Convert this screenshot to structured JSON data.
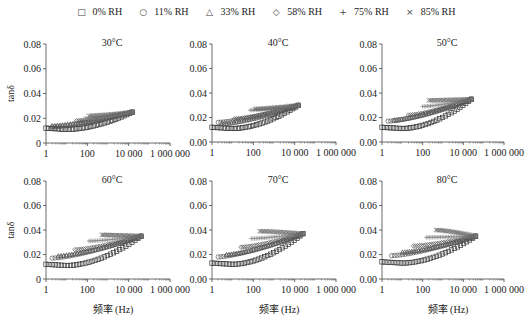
{
  "legend": [
    {
      "symbol": "□",
      "label": "0% RH"
    },
    {
      "symbol": "○",
      "label": "11% RH"
    },
    {
      "symbol": "△",
      "label": "33% RH"
    },
    {
      "symbol": "◇",
      "label": "58% RH"
    },
    {
      "symbol": "+",
      "label": "75% RH"
    },
    {
      "symbol": "×",
      "label": "85% RH"
    }
  ],
  "chart_data": [
    {
      "type": "scatter",
      "title": "30°C",
      "xlabel": "",
      "ylabel": "tanδ",
      "xscale": "log",
      "xlim": [
        1,
        1000000
      ],
      "ylim": [
        0,
        0.08
      ],
      "xticks": [
        "1",
        "100",
        "10 000",
        "1 000 000"
      ],
      "yticks": [
        "0",
        "0.02",
        "0.04",
        "0.06",
        "0.08"
      ],
      "series": [
        {
          "name": "0% RH",
          "start": [
            1,
            0.012
          ],
          "min": [
            10,
            0.011
          ],
          "end": [
            15000,
            0.025
          ]
        },
        {
          "name": "11% RH",
          "start": [
            2,
            0.013
          ],
          "end": [
            15000,
            0.025
          ]
        },
        {
          "name": "33% RH",
          "start": [
            2,
            0.014
          ],
          "peak": [
            8,
            0.016
          ],
          "end": [
            15000,
            0.025
          ]
        },
        {
          "name": "58% RH",
          "start": [
            30,
            0.018
          ],
          "end": [
            15000,
            0.025
          ]
        },
        {
          "name": "75% RH",
          "start": [
            80,
            0.02
          ],
          "end": [
            15000,
            0.025
          ]
        },
        {
          "name": "85% RH",
          "start": [
            120,
            0.022
          ],
          "end": [
            15000,
            0.025
          ]
        }
      ]
    },
    {
      "type": "scatter",
      "title": "40°C",
      "xlabel": "",
      "ylabel": "",
      "xscale": "log",
      "xlim": [
        1,
        1000000
      ],
      "ylim": [
        0,
        0.08
      ],
      "xticks": [
        "1",
        "100",
        "10 000",
        "1 000 000"
      ],
      "yticks": [
        "0.00",
        "0.02",
        "0.04",
        "0.06",
        "0.08"
      ],
      "series": [
        {
          "name": "0% RH",
          "start": [
            1,
            0.012
          ],
          "min": [
            10,
            0.011
          ],
          "end": [
            15000,
            0.03
          ]
        },
        {
          "name": "11% RH",
          "start": [
            2,
            0.016
          ],
          "end": [
            15000,
            0.03
          ]
        },
        {
          "name": "33% RH",
          "start": [
            3,
            0.015
          ],
          "end": [
            15000,
            0.03
          ]
        },
        {
          "name": "58% RH",
          "start": [
            12,
            0.019
          ],
          "end": [
            15000,
            0.03
          ]
        },
        {
          "name": "75% RH",
          "start": [
            70,
            0.026
          ],
          "end": [
            15000,
            0.03
          ]
        },
        {
          "name": "85% RH",
          "start": [
            120,
            0.027
          ],
          "end": [
            15000,
            0.03
          ]
        }
      ]
    },
    {
      "type": "scatter",
      "title": "50°C",
      "xlabel": "",
      "ylabel": "",
      "xscale": "log",
      "xlim": [
        1,
        1000000
      ],
      "ylim": [
        0,
        0.08
      ],
      "xticks": [
        "1",
        "100",
        "10 000",
        "1 000 000"
      ],
      "yticks": [
        "0.00",
        "0.02",
        "0.04",
        "0.06",
        "0.08"
      ],
      "series": [
        {
          "name": "0% RH",
          "start": [
            1,
            0.012
          ],
          "min": [
            10,
            0.011
          ],
          "end": [
            25000,
            0.035
          ]
        },
        {
          "name": "11% RH",
          "start": [
            2,
            0.017
          ],
          "end": [
            25000,
            0.035
          ]
        },
        {
          "name": "33% RH",
          "start": [
            4,
            0.018
          ],
          "end": [
            25000,
            0.035
          ]
        },
        {
          "name": "58% RH",
          "start": [
            20,
            0.022
          ],
          "end": [
            25000,
            0.035
          ]
        },
        {
          "name": "75% RH",
          "start": [
            100,
            0.029
          ],
          "end": [
            25000,
            0.035
          ]
        },
        {
          "name": "85% RH",
          "start": [
            200,
            0.034
          ],
          "end": [
            25000,
            0.035
          ]
        }
      ]
    },
    {
      "type": "scatter",
      "title": "60°C",
      "xlabel": "频率 (Hz)",
      "ylabel": "tanδ",
      "xscale": "log",
      "xlim": [
        1,
        1000000
      ],
      "ylim": [
        0,
        0.08
      ],
      "xticks": [
        "1",
        "100",
        "10 000",
        "1 000 000"
      ],
      "yticks": [
        "0",
        "0.02",
        "0.04",
        "0.06",
        "0.08"
      ],
      "series": [
        {
          "name": "0% RH",
          "start": [
            1,
            0.012
          ],
          "min": [
            10,
            0.011
          ],
          "end": [
            40000,
            0.035
          ]
        },
        {
          "name": "11% RH",
          "start": [
            2,
            0.017
          ],
          "end": [
            40000,
            0.035
          ]
        },
        {
          "name": "33% RH",
          "start": [
            4,
            0.019
          ],
          "end": [
            40000,
            0.035
          ]
        },
        {
          "name": "58% RH",
          "start": [
            25,
            0.024
          ],
          "end": [
            40000,
            0.035
          ]
        },
        {
          "name": "75% RH",
          "start": [
            120,
            0.031
          ],
          "end": [
            40000,
            0.035
          ]
        },
        {
          "name": "85% RH",
          "start": [
            500,
            0.036
          ],
          "end": [
            40000,
            0.035
          ]
        }
      ]
    },
    {
      "type": "scatter",
      "title": "70°C",
      "xlabel": "频率 (Hz)",
      "ylabel": "",
      "xscale": "log",
      "xlim": [
        1,
        1000000
      ],
      "ylim": [
        0,
        0.08
      ],
      "xticks": [
        "1",
        "100",
        "10 000",
        "1 000 000"
      ],
      "yticks": [
        "0.00",
        "0.02",
        "0.04",
        "0.06",
        "0.08"
      ],
      "series": [
        {
          "name": "0% RH",
          "start": [
            1,
            0.013
          ],
          "min": [
            10,
            0.012
          ],
          "end": [
            25000,
            0.037
          ]
        },
        {
          "name": "11% RH",
          "start": [
            2,
            0.018
          ],
          "end": [
            25000,
            0.037
          ]
        },
        {
          "name": "33% RH",
          "start": [
            5,
            0.02
          ],
          "end": [
            25000,
            0.037
          ]
        },
        {
          "name": "58% RH",
          "start": [
            25,
            0.026
          ],
          "end": [
            25000,
            0.037
          ]
        },
        {
          "name": "75% RH",
          "start": [
            80,
            0.033
          ],
          "end": [
            25000,
            0.037
          ]
        },
        {
          "name": "85% RH",
          "start": [
            200,
            0.039
          ],
          "end": [
            25000,
            0.037
          ]
        }
      ]
    },
    {
      "type": "scatter",
      "title": "80°C",
      "xlabel": "频率 (Hz)",
      "ylabel": "",
      "xscale": "log",
      "xlim": [
        1,
        1000000
      ],
      "ylim": [
        0,
        0.08
      ],
      "xticks": [
        "1",
        "100",
        "10 000",
        "1 000 000"
      ],
      "yticks": [
        "0.00",
        "0.02",
        "0.04",
        "0.06",
        "0.08"
      ],
      "series": [
        {
          "name": "0% RH",
          "start": [
            1,
            0.014
          ],
          "min": [
            10,
            0.013
          ],
          "end": [
            40000,
            0.035
          ]
        },
        {
          "name": "11% RH",
          "start": [
            3,
            0.019
          ],
          "end": [
            40000,
            0.035
          ]
        },
        {
          "name": "33% RH",
          "start": [
            10,
            0.022
          ],
          "end": [
            40000,
            0.035
          ]
        },
        {
          "name": "58% RH",
          "start": [
            35,
            0.027
          ],
          "end": [
            40000,
            0.035
          ]
        },
        {
          "name": "75% RH",
          "start": [
            150,
            0.034
          ],
          "end": [
            40000,
            0.035
          ]
        },
        {
          "name": "85% RH",
          "start": [
            450,
            0.04
          ],
          "end": [
            40000,
            0.035
          ]
        }
      ]
    }
  ]
}
